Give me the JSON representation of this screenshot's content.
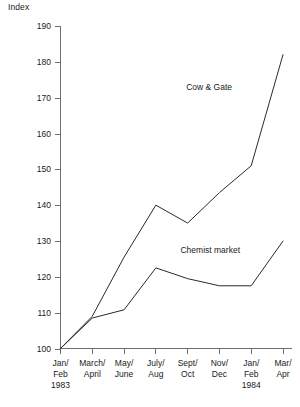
{
  "chart_data": {
    "type": "line",
    "title": "",
    "ylabel": "Index",
    "xlabel": "",
    "ylim": [
      100,
      190
    ],
    "ytick_step": 10,
    "grid": false,
    "legend": "inline-annotations",
    "yticks": [
      100,
      110,
      120,
      130,
      140,
      150,
      160,
      170,
      180,
      190
    ],
    "categories": [
      "Jan/\nFeb\n1983",
      "March/\nApril",
      "May/\nJune",
      "July/\nAug",
      "Sept/\nOct",
      "Nov/\nDec",
      "Jan/\nFeb\n1984",
      "Mar/\nApr"
    ],
    "category_lines": [
      [
        "Jan/",
        "Feb",
        "1983"
      ],
      [
        "March/",
        "April"
      ],
      [
        "May/",
        "June"
      ],
      [
        "July/",
        "Aug"
      ],
      [
        "Sept/",
        "Oct"
      ],
      [
        "Nov/",
        "Dec"
      ],
      [
        "Jan/",
        "Feb",
        "1984"
      ],
      [
        "Mar/",
        "Apr"
      ]
    ],
    "series": [
      {
        "name": "Cow & Gate",
        "values": [
          100,
          109,
          125.5,
          140,
          135,
          143.5,
          151,
          182
        ],
        "label_anchor_index": 5
      },
      {
        "name": "Chemist market",
        "values": [
          100,
          108.5,
          110.8,
          122.5,
          119.5,
          117.5,
          117.5,
          130
        ],
        "label_anchor_index": 6
      }
    ],
    "annotations": [
      {
        "text": "Cow & Gate",
        "x": 232,
        "y": 90
      },
      {
        "text": "Chemist market",
        "x": 240,
        "y": 253
      }
    ],
    "colors": {
      "line": "#2a2a2a",
      "axis": "#6e6e6e",
      "text": "#1a1a1a",
      "background": "#ffffff"
    }
  }
}
